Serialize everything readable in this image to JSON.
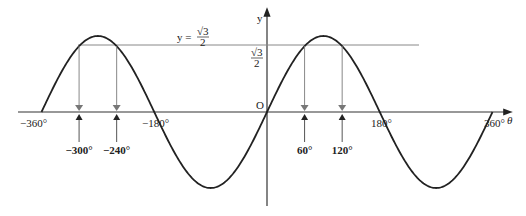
{
  "chart_data": {
    "type": "line",
    "title": "",
    "function": "y = sin θ",
    "xlabel": "θ",
    "ylabel": "y",
    "xlim": [
      -360,
      360
    ],
    "ylim": [
      -1,
      1
    ],
    "x_ticks": [
      "−360°",
      "−180°",
      "180°",
      "360°"
    ],
    "origin_label": "O",
    "horizontal_line": {
      "label_prefix": "y =",
      "label_num": "√3",
      "label_den": "2",
      "value": 0.866
    },
    "y_tick_label": {
      "num": "√3",
      "den": "2"
    },
    "solutions": [
      {
        "label": "−300°",
        "x": -300
      },
      {
        "label": "−240°",
        "x": -240
      },
      {
        "label": "60°",
        "x": 60
      },
      {
        "label": "120°",
        "x": 120
      }
    ],
    "grid": false
  }
}
